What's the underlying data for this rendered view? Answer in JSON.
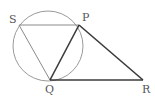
{
  "diagram": {
    "type": "geometry",
    "circle": {
      "cx": 48,
      "cy": 46,
      "r": 35,
      "color": "#9a9a9a"
    },
    "points": {
      "S": {
        "x": 19,
        "y": 25,
        "label": "S",
        "lx": 9,
        "ly": 23
      },
      "P": {
        "x": 79,
        "y": 25,
        "label": "P",
        "lx": 82,
        "ly": 21
      },
      "Q": {
        "x": 50,
        "y": 80,
        "label": "Q",
        "lx": 45,
        "ly": 93
      },
      "R": {
        "x": 143,
        "y": 80,
        "label": "R",
        "lx": 142,
        "ly": 93
      }
    },
    "segments": [
      {
        "from": "S",
        "to": "P",
        "weight": "thin"
      },
      {
        "from": "S",
        "to": "Q",
        "weight": "thin"
      },
      {
        "from": "P",
        "to": "Q",
        "weight": "thick"
      },
      {
        "from": "P",
        "to": "R",
        "weight": "thick"
      },
      {
        "from": "Q",
        "to": "R",
        "weight": "thick"
      }
    ],
    "labels": [
      "S",
      "P",
      "Q",
      "R"
    ]
  }
}
